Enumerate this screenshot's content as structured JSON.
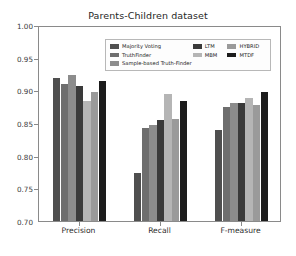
{
  "chart_data": {
    "type": "bar",
    "title": "Parents-Children dataset",
    "xlabel": "",
    "ylabel": "",
    "ylim": [
      0.7,
      1.0
    ],
    "yticks": [
      "1.00",
      "0.95",
      "0.90",
      "0.85",
      "0.80",
      "0.75",
      "0.70"
    ],
    "ytick_values": [
      1.0,
      0.95,
      0.9,
      0.85,
      0.8,
      0.75,
      0.7
    ],
    "grid": false,
    "legend_position": "upper center",
    "categories": [
      "Precision",
      "Recall",
      "F-measure"
    ],
    "series": [
      {
        "name": "Majority Voting",
        "color": "#4f4f4f",
        "values": [
          0.919,
          0.773,
          0.84
        ]
      },
      {
        "name": "TruthFinder",
        "color": "#6e6e6e",
        "values": [
          0.91,
          0.843,
          0.875
        ]
      },
      {
        "name": "Sample-based Truth-Finder",
        "color": "#8c8c8c",
        "values": [
          0.924,
          0.847,
          0.881
        ]
      },
      {
        "name": "LTM",
        "color": "#3a3a3a",
        "values": [
          0.906,
          0.855,
          0.88
        ]
      },
      {
        "name": "MBM",
        "color": "#b5b5b5",
        "values": [
          0.883,
          0.894,
          0.888
        ]
      },
      {
        "name": "HYBRID",
        "color": "#9a9a9a",
        "values": [
          0.897,
          0.856,
          0.877
        ]
      },
      {
        "name": "MTDF",
        "color": "#1c1c1c",
        "values": [
          0.915,
          0.884,
          0.898
        ]
      }
    ]
  },
  "legend": {
    "col1": [
      "Majority Voting",
      "TruthFinder",
      "Sample-based Truth-Finder"
    ],
    "col2": [
      "LTM",
      "MBM"
    ],
    "col3": [
      "HYBRID",
      "MTDF"
    ]
  }
}
